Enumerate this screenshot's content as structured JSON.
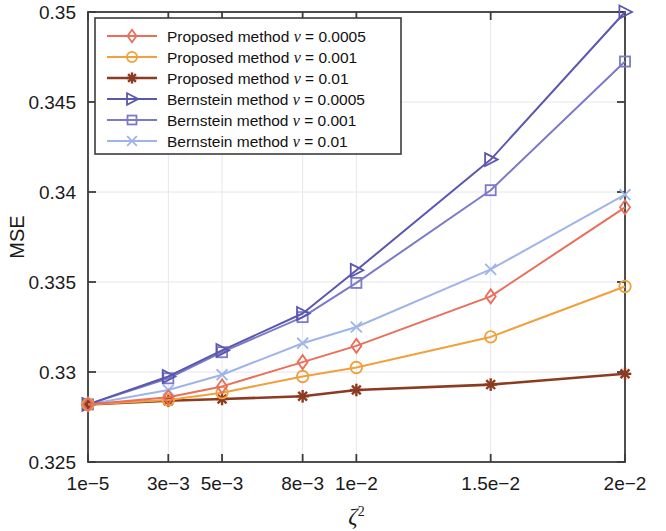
{
  "chart_data": {
    "type": "line",
    "title": "",
    "xlabel": "ζ²",
    "ylabel": "MSE",
    "x_tick_labels": [
      "1e−5",
      "3e−3",
      "5e−3",
      "8e−3",
      "1e−2",
      "1.5e−2",
      "2e−2"
    ],
    "x_values": [
      1e-05,
      0.003,
      0.005,
      0.008,
      0.01,
      0.015,
      0.02
    ],
    "y_tick_labels": [
      "0.325",
      "0.33",
      "0.335",
      "0.34",
      "0.345",
      "0.35"
    ],
    "y_ticks": [
      0.325,
      0.33,
      0.335,
      0.34,
      0.345,
      0.35
    ],
    "ylim": [
      0.325,
      0.35
    ],
    "xlim": [
      1e-05,
      0.02
    ],
    "grid": true,
    "legend_position": "top-left",
    "series": [
      {
        "name": "Proposed method ν = 0.0005",
        "label_prefix": "Proposed method",
        "nu": "0.0005",
        "color": "#e8705a",
        "marker": "diamond",
        "values": [
          0.3282,
          0.3286,
          0.3292,
          0.33055,
          0.33145,
          0.3342,
          0.33915
        ]
      },
      {
        "name": "Proposed method ν = 0.001",
        "label_prefix": "Proposed method",
        "nu": "0.001",
        "color": "#f0a03c",
        "marker": "circle",
        "values": [
          0.3282,
          0.32845,
          0.32885,
          0.32975,
          0.33025,
          0.33195,
          0.33475
        ]
      },
      {
        "name": "Proposed method ν = 0.01",
        "label_prefix": "Proposed method",
        "nu": "0.01",
        "color": "#8c3a20",
        "marker": "star",
        "values": [
          0.3282,
          0.3284,
          0.3285,
          0.32865,
          0.329,
          0.3293,
          0.3299
        ]
      },
      {
        "name": "Bernstein method ν = 0.0005",
        "label_prefix": "Bernstein method",
        "nu": "0.0005",
        "color": "#5a57b0",
        "marker": "triangle",
        "values": [
          0.3282,
          0.32975,
          0.3312,
          0.33325,
          0.33565,
          0.3418,
          0.35
        ]
      },
      {
        "name": "Bernstein method ν = 0.001",
        "label_prefix": "Bernstein method",
        "nu": "0.001",
        "color": "#7b7ac8",
        "marker": "square",
        "values": [
          0.3282,
          0.32965,
          0.3311,
          0.33305,
          0.33495,
          0.3401,
          0.34725
        ]
      },
      {
        "name": "Bernstein method ν = 0.01",
        "label_prefix": "Bernstein method",
        "nu": "0.01",
        "color": "#9fb4e8",
        "marker": "x",
        "values": [
          0.3282,
          0.329,
          0.32985,
          0.3316,
          0.3325,
          0.3357,
          0.33985
        ]
      }
    ]
  },
  "axes": {
    "y_title": "MSE",
    "x_title": "ζ²"
  }
}
